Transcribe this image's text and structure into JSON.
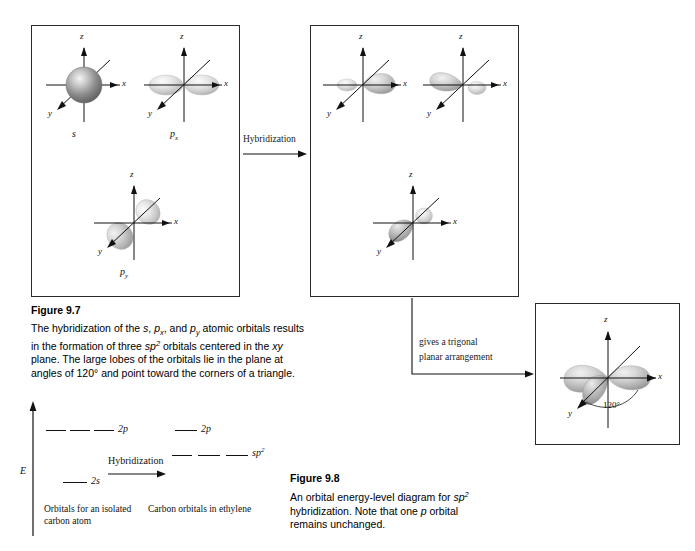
{
  "figure_7": {
    "title": "Figure 9.7",
    "caption_line1_pre": "The hybridization of the ",
    "caption_s": "s",
    "caption_comma1": ", ",
    "caption_px": "p",
    "caption_px_sub": "x",
    "caption_comma2": ", and ",
    "caption_py": "p",
    "caption_py_sub": "y",
    "caption_line1_post": " atomic orbitals results in",
    "caption_line2_pre": "the formation of three ",
    "caption_sp": "sp",
    "caption_sp_sup": "2",
    "caption_line2_post": " orbitals centered in the ",
    "caption_xy": "xy",
    "caption_line2_end": " plane. The",
    "caption_line3": "large lobes of the orbitals lie in the plane at angles of 120° and",
    "caption_line4": "point toward the corners of a triangle.",
    "full_caption": "The hybridization of the s, px, and py atomic orbitals results in the formation of three sp2 orbitals centered in the xy plane. The large lobes of the orbitals lie in the plane at angles of 120° and point toward the corners of a triangle."
  },
  "figure_8": {
    "title": "Figure 9.8",
    "line1": "An orbital energy-level diagram for",
    "line2_sp": "sp",
    "line2_sup": "2",
    "line2_rest": " hybridization. Note that one ",
    "line2_p": "p",
    "line3": "orbital remains unchanged.",
    "full_caption": "An orbital energy-level diagram for sp2 hybridization. Note that one p orbital remains unchanged."
  },
  "panels": {
    "atomic": {
      "name": "atomic orbitals panel",
      "orbitals": [
        {
          "label_main": "s",
          "label_sub": "",
          "type": "s-sphere",
          "axes": [
            "z",
            "x",
            "y"
          ]
        },
        {
          "label_main": "p",
          "label_sub": "x",
          "type": "p-x",
          "axes": [
            "z",
            "x",
            "y"
          ]
        },
        {
          "label_main": "p",
          "label_sub": "y",
          "type": "p-y",
          "axes": [
            "z",
            "x",
            "y"
          ]
        }
      ]
    },
    "hybrid": {
      "name": "sp2 hybrid orbitals panel",
      "orbitals": [
        {
          "type": "sp2-right",
          "axes": [
            "z",
            "x",
            "y"
          ]
        },
        {
          "type": "sp2-upleft",
          "axes": [
            "z",
            "x",
            "y"
          ]
        },
        {
          "type": "sp2-downleft",
          "axes": [
            "z",
            "x",
            "y"
          ]
        }
      ]
    },
    "trigonal": {
      "name": "trigonal planar arrangement panel",
      "angle_label": "120°",
      "axes": [
        "z",
        "x",
        "y"
      ]
    }
  },
  "connectors": {
    "hybridization_arrow_label": "Hybridization",
    "trigonal_arrow_label_line1": "gives a trigonal",
    "trigonal_arrow_label_line2": "planar arrangement"
  },
  "energy_diagram": {
    "axis_label": "E",
    "hybridization_label": "Hybridization",
    "left_caption_line1": "Orbitals for an isolated",
    "left_caption_line2": "carbon atom",
    "right_caption": "Carbon orbitals in ethylene",
    "levels": [
      {
        "id": "left-2p",
        "label_main": "2p",
        "label_sup": "",
        "count": 3,
        "side": "left"
      },
      {
        "id": "left-2s",
        "label_main": "2s",
        "label_sup": "",
        "count": 1,
        "side": "left"
      },
      {
        "id": "right-2p",
        "label_main": "2p",
        "label_sup": "",
        "count": 1,
        "side": "right"
      },
      {
        "id": "right-sp2",
        "label_main": "sp",
        "label_sup": "2",
        "count": 3,
        "side": "right"
      }
    ]
  },
  "axis_letters": {
    "z": "z",
    "x": "x",
    "y": "y"
  },
  "colors": {
    "border": "#2a2a2a",
    "axis": "#111111",
    "text": "#000000",
    "orbital_light": "#e8e8e8",
    "orbital_mid": "#bdbdbd",
    "orbital_dark": "#8a8a8a"
  }
}
